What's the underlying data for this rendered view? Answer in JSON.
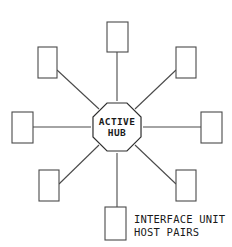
{
  "diagram": {
    "background_color": "#ffffff",
    "line_color": "#4a4a4a",
    "hub_line_color": "#2e2e2e",
    "text_color": "#1a1a1a",
    "hub": {
      "shape": "octagon",
      "label_line1": "ACTIVE",
      "label_line2": "HUB",
      "center_x": 117,
      "center_y": 127,
      "radius": 26
    },
    "caption": {
      "line1": "INTERFACE UNIT",
      "line2": "HOST PAIRS",
      "x": 134,
      "y1": 220,
      "y2": 233
    },
    "nodes": [
      {
        "name": "node-north",
        "direction": "north",
        "x": 107,
        "y": 22,
        "width": 21,
        "height": 30
      },
      {
        "name": "node-northeast",
        "direction": "northeast",
        "x": 176,
        "y": 47,
        "width": 20,
        "height": 31
      },
      {
        "name": "node-east",
        "direction": "east",
        "x": 201,
        "y": 112,
        "width": 21,
        "height": 31
      },
      {
        "name": "node-southeast",
        "direction": "southeast",
        "x": 176,
        "y": 170,
        "width": 20,
        "height": 31
      },
      {
        "name": "node-south",
        "direction": "south",
        "x": 105,
        "y": 207,
        "width": 21,
        "height": 33
      },
      {
        "name": "node-southwest",
        "direction": "southwest",
        "x": 39,
        "y": 170,
        "width": 20,
        "height": 31
      },
      {
        "name": "node-west",
        "direction": "west",
        "x": 12,
        "y": 112,
        "width": 21,
        "height": 31
      },
      {
        "name": "node-northwest",
        "direction": "northwest",
        "x": 38,
        "y": 47,
        "width": 19,
        "height": 31
      }
    ],
    "spokes": [
      {
        "name": "spoke-north",
        "x1": 117,
        "y1": 101,
        "x2": 117,
        "y2": 52
      },
      {
        "name": "spoke-northeast",
        "x1": 135,
        "y1": 109,
        "x2": 176,
        "y2": 70
      },
      {
        "name": "spoke-east",
        "x1": 143,
        "y1": 127,
        "x2": 201,
        "y2": 127
      },
      {
        "name": "spoke-southeast",
        "x1": 135,
        "y1": 145,
        "x2": 176,
        "y2": 184
      },
      {
        "name": "spoke-south",
        "x1": 117,
        "y1": 153,
        "x2": 117,
        "y2": 207
      },
      {
        "name": "spoke-southwest",
        "x1": 99,
        "y1": 145,
        "x2": 59,
        "y2": 184
      },
      {
        "name": "spoke-west",
        "x1": 91,
        "y1": 127,
        "x2": 33,
        "y2": 127
      },
      {
        "name": "spoke-northwest",
        "x1": 99,
        "y1": 109,
        "x2": 57,
        "y2": 70
      }
    ]
  }
}
